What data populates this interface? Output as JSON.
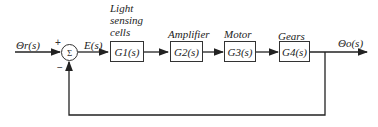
{
  "diagram": {
    "input_label": "Θr(s)",
    "output_label": "Θo(s)",
    "error_label": "E(s)",
    "summing_junction": {
      "symbol": "Σ",
      "input_sign": "+",
      "feedback_sign": "−"
    },
    "blocks": [
      {
        "id": "G1",
        "name": "G1(s)",
        "caption_lines": [
          "Light",
          "sensing",
          "cells"
        ]
      },
      {
        "id": "G2",
        "name": "G2(s)",
        "caption_lines": [
          "Amplifier"
        ]
      },
      {
        "id": "G3",
        "name": "G3(s)",
        "caption_lines": [
          "Motor"
        ]
      },
      {
        "id": "G4",
        "name": "G4(s)",
        "caption_lines": [
          "Gears"
        ]
      }
    ],
    "feedback": "unity negative feedback"
  }
}
